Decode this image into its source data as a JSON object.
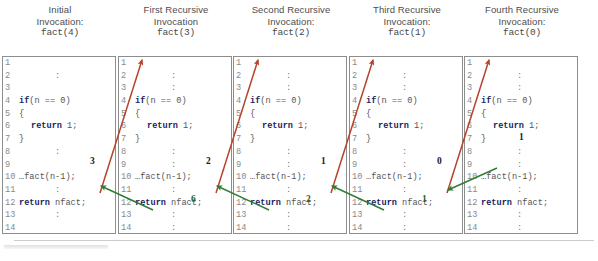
{
  "figure": {
    "title_alt": "Recursive factorial call trace",
    "colors": {
      "call_arrow": "#b5442b",
      "return_arrow": "#2f7d32",
      "keyword": "#1b1f60",
      "code_text": "#555555",
      "line_number": "#8a8a8a",
      "box_border": "#8d8d8d"
    }
  },
  "panels": [
    {
      "header": {
        "line1": "Initial",
        "line2": "Invocation:",
        "call": "fact(4)"
      },
      "lines": [
        {
          "n": "1",
          "text": "",
          "colon": false
        },
        {
          "n": "2",
          "text": "",
          "colon": true
        },
        {
          "n": "3",
          "text": "",
          "colon": false
        },
        {
          "n": "4",
          "kw": "if",
          "text": "(n == 0)",
          "colon": false
        },
        {
          "n": "5",
          "text": "{",
          "colon": false
        },
        {
          "n": "6",
          "kw": "return",
          "text": " 1;",
          "indent": true,
          "colon": false
        },
        {
          "n": "7",
          "text": "}",
          "colon": false
        },
        {
          "n": "8",
          "text": "",
          "colon": true
        },
        {
          "n": "9",
          "text": "",
          "colon": false
        },
        {
          "n": "10",
          "text": "…fact(n-1);",
          "colon": false
        },
        {
          "n": "11",
          "text": "",
          "colon": true
        },
        {
          "n": "12",
          "kw": "return",
          "text": " nfact;",
          "colon": false
        },
        {
          "n": "13",
          "text": "",
          "colon": true
        },
        {
          "n": "14",
          "text": "",
          "colon": false
        }
      ],
      "annotations": [
        {
          "value": "3",
          "color": "black",
          "x": 88,
          "y": 156
        }
      ]
    },
    {
      "header": {
        "line1": "First Recursive",
        "line2": "Invocation",
        "call": "fact(3)"
      },
      "lines": [
        {
          "n": "1",
          "text": "",
          "colon": false
        },
        {
          "n": "2",
          "text": "",
          "colon": true
        },
        {
          "n": "3",
          "text": "",
          "colon": true
        },
        {
          "n": "4",
          "kw": "if",
          "text": "(n == 0)",
          "colon": false
        },
        {
          "n": "5",
          "text": "{",
          "colon": false
        },
        {
          "n": "6",
          "kw": "return",
          "text": " 1;",
          "indent": true,
          "colon": false
        },
        {
          "n": "7",
          "text": "}",
          "colon": false
        },
        {
          "n": "8",
          "text": "",
          "colon": true
        },
        {
          "n": "9",
          "text": "",
          "colon": true
        },
        {
          "n": "10",
          "text": "…fact(n-1);",
          "colon": false
        },
        {
          "n": "11",
          "text": "",
          "colon": true
        },
        {
          "n": "12",
          "kw": "return",
          "text": " nfact;",
          "colon": false
        },
        {
          "n": "13",
          "text": "",
          "colon": true
        },
        {
          "n": "14",
          "text": "",
          "colon": true
        }
      ],
      "annotations": [
        {
          "value": "2",
          "color": "black",
          "x": 88,
          "y": 156
        },
        {
          "value": "6",
          "color": "green",
          "x": 73,
          "y": 194
        }
      ]
    },
    {
      "header": {
        "line1": "Second Recursive",
        "line2": "Invocation:",
        "call": "fact(2)"
      },
      "lines": [
        {
          "n": "1",
          "text": "",
          "colon": false
        },
        {
          "n": "2",
          "text": "",
          "colon": true
        },
        {
          "n": "3",
          "text": "",
          "colon": true
        },
        {
          "n": "4",
          "kw": "if",
          "text": "(n == 0)",
          "colon": false
        },
        {
          "n": "5",
          "text": "{",
          "colon": false
        },
        {
          "n": "6",
          "kw": "return",
          "text": " 1;",
          "indent": true,
          "colon": false
        },
        {
          "n": "7",
          "text": "}",
          "colon": false
        },
        {
          "n": "8",
          "text": "",
          "colon": true
        },
        {
          "n": "9",
          "text": "",
          "colon": true
        },
        {
          "n": "10",
          "text": "…fact(n-1);",
          "colon": false
        },
        {
          "n": "11",
          "text": "",
          "colon": true
        },
        {
          "n": "12",
          "kw": "return",
          "text": " nfact;",
          "colon": false
        },
        {
          "n": "13",
          "text": "",
          "colon": true
        },
        {
          "n": "14",
          "text": "",
          "colon": true
        }
      ],
      "annotations": [
        {
          "value": "1",
          "color": "black",
          "x": 88,
          "y": 156
        },
        {
          "value": "2",
          "color": "green",
          "x": 73,
          "y": 194
        }
      ]
    },
    {
      "header": {
        "line1": "Third Recursive",
        "line2": "Invocation:",
        "call": "fact(1)"
      },
      "lines": [
        {
          "n": "1",
          "text": "",
          "colon": false
        },
        {
          "n": "2",
          "text": "",
          "colon": true
        },
        {
          "n": "3",
          "text": "",
          "colon": true
        },
        {
          "n": "4",
          "kw": "if",
          "text": "(n == 0)",
          "colon": false
        },
        {
          "n": "5",
          "text": "{",
          "colon": false
        },
        {
          "n": "6",
          "kw": "return",
          "text": " 1;",
          "indent": true,
          "colon": false
        },
        {
          "n": "7",
          "text": "}",
          "colon": false
        },
        {
          "n": "8",
          "text": "",
          "colon": true
        },
        {
          "n": "9",
          "text": "",
          "colon": true
        },
        {
          "n": "10",
          "text": "…fact(n-1);",
          "colon": false
        },
        {
          "n": "11",
          "text": "",
          "colon": true
        },
        {
          "n": "12",
          "kw": "return",
          "text": " nfact;",
          "colon": false
        },
        {
          "n": "13",
          "text": "",
          "colon": true
        },
        {
          "n": "14",
          "text": "",
          "colon": true
        }
      ],
      "annotations": [
        {
          "value": "0",
          "color": "black",
          "x": 88,
          "y": 156
        },
        {
          "value": "1",
          "color": "green",
          "x": 73,
          "y": 194
        }
      ]
    },
    {
      "header": {
        "line1": "Fourth Recursive",
        "line2": "Invocation:",
        "call": "fact(0)"
      },
      "lines": [
        {
          "n": "1",
          "text": "",
          "colon": false
        },
        {
          "n": "2",
          "text": "",
          "colon": true
        },
        {
          "n": "3",
          "text": "",
          "colon": true
        },
        {
          "n": "4",
          "kw": "if",
          "text": "(n == 0)",
          "colon": false
        },
        {
          "n": "5",
          "text": "{",
          "colon": false
        },
        {
          "n": "6",
          "kw": "return",
          "text": " 1;",
          "indent": true,
          "colon": false
        },
        {
          "n": "7",
          "text": "}",
          "colon": false
        },
        {
          "n": "8",
          "text": "",
          "colon": true
        },
        {
          "n": "9",
          "text": "",
          "colon": true
        },
        {
          "n": "10",
          "text": "…fact(n-1);",
          "colon": false
        },
        {
          "n": "11",
          "text": "",
          "colon": true
        },
        {
          "n": "12",
          "kw": "return",
          "text": " nfact;",
          "colon": false
        },
        {
          "n": "13",
          "text": "",
          "colon": true
        },
        {
          "n": "14",
          "text": "",
          "colon": true
        }
      ],
      "annotations": [
        {
          "value": "1",
          "color": "black",
          "x": 55,
          "y": 132
        }
      ]
    }
  ],
  "arrows": {
    "call": [
      {
        "from": [
          100,
          193
        ],
        "to": [
          142,
          60
        ]
      },
      {
        "from": [
          216,
          193
        ],
        "to": [
          258,
          60
        ]
      },
      {
        "from": [
          331,
          193
        ],
        "to": [
          373,
          60
        ]
      },
      {
        "from": [
          447,
          193
        ],
        "to": [
          489,
          60
        ]
      }
    ],
    "return": [
      {
        "from": [
          153,
          210
        ],
        "to": [
          101,
          186
        ]
      },
      {
        "from": [
          269,
          210
        ],
        "to": [
          217,
          186
        ]
      },
      {
        "from": [
          384,
          210
        ],
        "to": [
          332,
          186
        ]
      },
      {
        "from": [
          497,
          168
        ],
        "to": [
          448,
          190
        ]
      }
    ]
  }
}
